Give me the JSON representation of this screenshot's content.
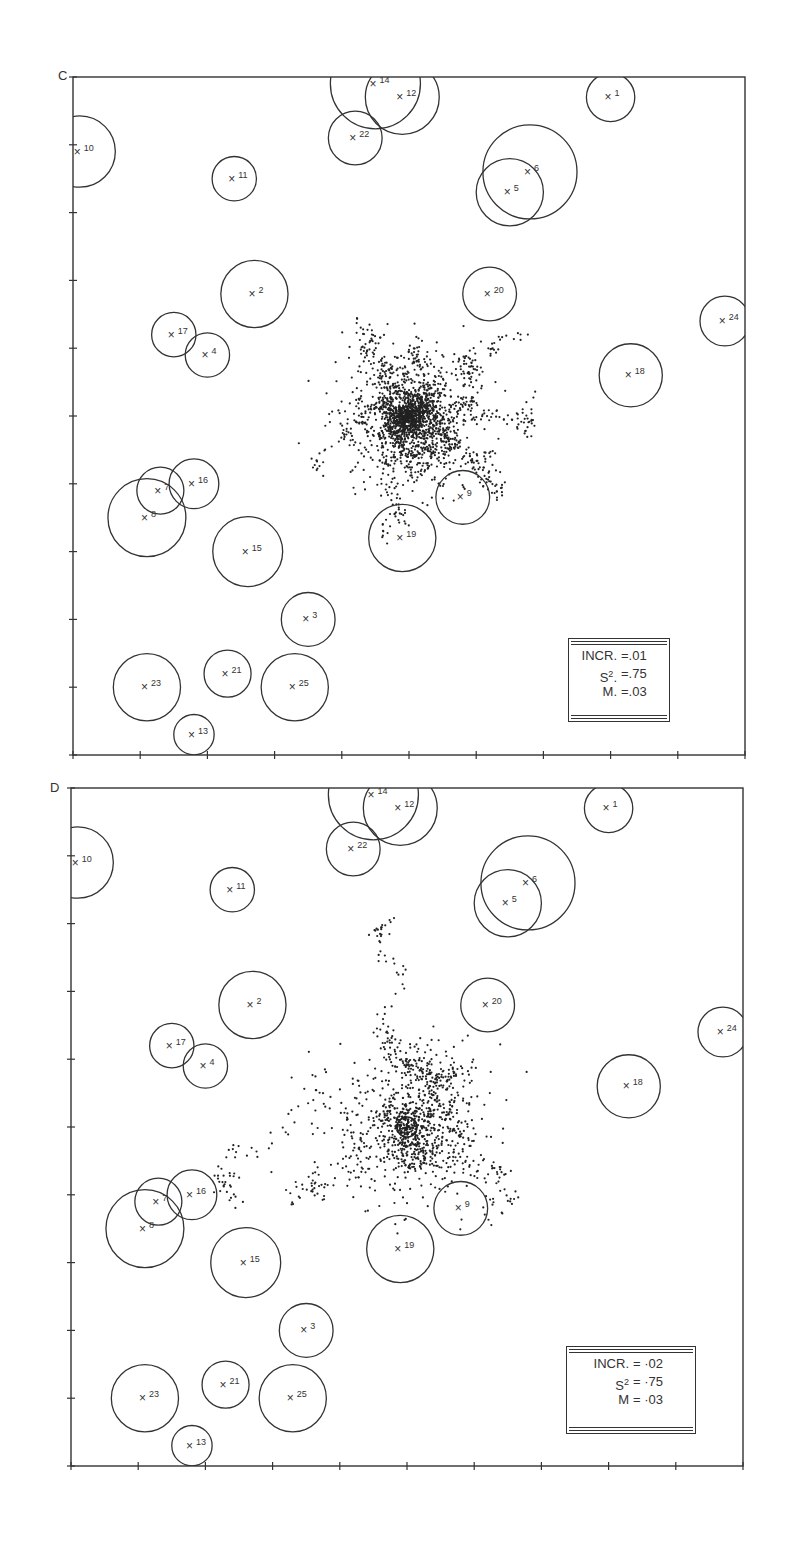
{
  "chart_data": [
    {
      "type": "scatter",
      "panel_label": "C",
      "title": "",
      "xlabel": "",
      "ylabel": "",
      "grid": false,
      "axis_ticks": {
        "x": 10,
        "y": 10
      },
      "xlim": [
        0,
        10
      ],
      "ylim": [
        0,
        10
      ],
      "legend": {
        "position": "lower-right",
        "entries": [
          {
            "key": "INCR.",
            "value": "=.01"
          },
          {
            "key": "S2.",
            "value": "=.75"
          },
          {
            "key": "M.",
            "value": "=.03"
          }
        ]
      },
      "sites": [
        {
          "id": "1",
          "x": 8.0,
          "y": 9.7,
          "r": 0.36
        },
        {
          "id": "2",
          "x": 2.7,
          "y": 6.8,
          "r": 0.5
        },
        {
          "id": "3",
          "x": 3.5,
          "y": 2.0,
          "r": 0.4
        },
        {
          "id": "4",
          "x": 2.0,
          "y": 5.9,
          "r": 0.33
        },
        {
          "id": "5",
          "x": 6.5,
          "y": 8.3,
          "r": 0.5
        },
        {
          "id": "6",
          "x": 6.8,
          "y": 8.6,
          "r": 0.7
        },
        {
          "id": "7",
          "x": 1.3,
          "y": 3.9,
          "r": 0.35
        },
        {
          "id": "8",
          "x": 1.1,
          "y": 3.5,
          "r": 0.58
        },
        {
          "id": "9",
          "x": 5.8,
          "y": 3.8,
          "r": 0.4
        },
        {
          "id": "10",
          "x": 0.1,
          "y": 8.9,
          "r": 0.53
        },
        {
          "id": "11",
          "x": 2.4,
          "y": 8.5,
          "r": 0.33
        },
        {
          "id": "12",
          "x": 4.9,
          "y": 9.7,
          "r": 0.55
        },
        {
          "id": "14",
          "x": 4.5,
          "y": 9.9,
          "r": 0.67
        },
        {
          "id": "13",
          "x": 1.8,
          "y": 0.3,
          "r": 0.3
        },
        {
          "id": "15",
          "x": 2.6,
          "y": 3.0,
          "r": 0.52
        },
        {
          "id": "16",
          "x": 1.8,
          "y": 4.0,
          "r": 0.37
        },
        {
          "id": "17",
          "x": 1.5,
          "y": 6.2,
          "r": 0.33
        },
        {
          "id": "18",
          "x": 8.3,
          "y": 5.6,
          "r": 0.47
        },
        {
          "id": "19",
          "x": 4.9,
          "y": 3.2,
          "r": 0.5
        },
        {
          "id": "20",
          "x": 6.2,
          "y": 6.8,
          "r": 0.4
        },
        {
          "id": "21",
          "x": 2.3,
          "y": 1.2,
          "r": 0.35
        },
        {
          "id": "22",
          "x": 4.2,
          "y": 9.1,
          "r": 0.4
        },
        {
          "id": "23",
          "x": 1.1,
          "y": 1.0,
          "r": 0.5
        },
        {
          "id": "24",
          "x": 9.7,
          "y": 6.4,
          "r": 0.37
        },
        {
          "id": "25",
          "x": 3.3,
          "y": 1.0,
          "r": 0.5
        }
      ],
      "trajectory": {
        "center": [
          5.0,
          5.0
        ],
        "spread": 2.2,
        "style": "dotted random walk, dense core around centre"
      }
    },
    {
      "type": "scatter",
      "panel_label": "D",
      "title": "",
      "xlabel": "",
      "ylabel": "",
      "grid": false,
      "axis_ticks": {
        "x": 10,
        "y": 10
      },
      "xlim": [
        0,
        10
      ],
      "ylim": [
        0,
        10
      ],
      "legend": {
        "position": "lower-right",
        "entries": [
          {
            "key": "INCR.",
            "value": "= ·02"
          },
          {
            "key": "S2",
            "value": "= ·75"
          },
          {
            "key": "M",
            "value": "= ·03"
          }
        ]
      },
      "sites": [
        {
          "id": "1",
          "x": 8.0,
          "y": 9.7,
          "r": 0.36
        },
        {
          "id": "2",
          "x": 2.7,
          "y": 6.8,
          "r": 0.5
        },
        {
          "id": "3",
          "x": 3.5,
          "y": 2.0,
          "r": 0.4
        },
        {
          "id": "4",
          "x": 2.0,
          "y": 5.9,
          "r": 0.33
        },
        {
          "id": "5",
          "x": 6.5,
          "y": 8.3,
          "r": 0.5
        },
        {
          "id": "6",
          "x": 6.8,
          "y": 8.6,
          "r": 0.7
        },
        {
          "id": "7",
          "x": 1.3,
          "y": 3.9,
          "r": 0.35
        },
        {
          "id": "8",
          "x": 1.1,
          "y": 3.5,
          "r": 0.58
        },
        {
          "id": "9",
          "x": 5.8,
          "y": 3.8,
          "r": 0.4
        },
        {
          "id": "10",
          "x": 0.1,
          "y": 8.9,
          "r": 0.53
        },
        {
          "id": "11",
          "x": 2.4,
          "y": 8.5,
          "r": 0.33
        },
        {
          "id": "12",
          "x": 4.9,
          "y": 9.7,
          "r": 0.55
        },
        {
          "id": "14",
          "x": 4.5,
          "y": 9.9,
          "r": 0.67
        },
        {
          "id": "13",
          "x": 1.8,
          "y": 0.3,
          "r": 0.3
        },
        {
          "id": "15",
          "x": 2.6,
          "y": 3.0,
          "r": 0.52
        },
        {
          "id": "16",
          "x": 1.8,
          "y": 4.0,
          "r": 0.37
        },
        {
          "id": "17",
          "x": 1.5,
          "y": 6.2,
          "r": 0.33
        },
        {
          "id": "18",
          "x": 8.3,
          "y": 5.6,
          "r": 0.47
        },
        {
          "id": "19",
          "x": 4.9,
          "y": 3.2,
          "r": 0.5
        },
        {
          "id": "20",
          "x": 6.2,
          "y": 6.8,
          "r": 0.4
        },
        {
          "id": "21",
          "x": 2.3,
          "y": 1.2,
          "r": 0.35
        },
        {
          "id": "22",
          "x": 4.2,
          "y": 9.1,
          "r": 0.4
        },
        {
          "id": "23",
          "x": 1.1,
          "y": 1.0,
          "r": 0.5
        },
        {
          "id": "24",
          "x": 9.7,
          "y": 6.4,
          "r": 0.37
        },
        {
          "id": "25",
          "x": 3.3,
          "y": 1.0,
          "r": 0.5
        }
      ],
      "trajectory": {
        "center": [
          5.0,
          5.0
        ],
        "spread": 2.8,
        "style": "sparse dotted random walk, wider scatter"
      }
    }
  ]
}
